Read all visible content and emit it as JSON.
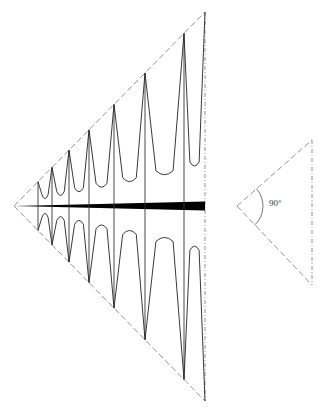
{
  "diagram": {
    "type": "log-periodic antenna schematic",
    "main_triangle": {
      "apex": [
        14,
        206
      ],
      "top": [
        205,
        12
      ],
      "bottom": [
        205,
        401
      ],
      "stroke": "#777777"
    },
    "boom": {
      "x_start": 14,
      "x_end": 205,
      "y": 206,
      "max_thickness": 9,
      "color": "#000000"
    },
    "elements_x": [
      38,
      52,
      69,
      89,
      114,
      145,
      184
    ],
    "trough_depth_ratio": 0.22,
    "angle_triangle": {
      "apex": [
        237,
        206
      ],
      "top": [
        312,
        140
      ],
      "bottom": [
        312,
        285
      ],
      "angle_label": "90°",
      "stroke": "#777777"
    },
    "curve_color": "#222222"
  }
}
